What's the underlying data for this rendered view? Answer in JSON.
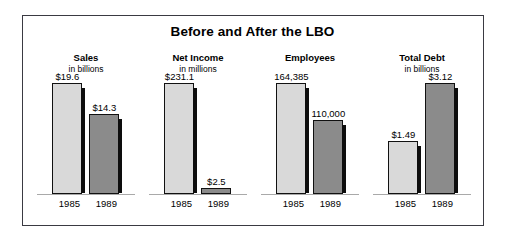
{
  "chart_data": {
    "type": "bar",
    "title": "Before and After the LBO",
    "xlabel": "",
    "ylabel": "",
    "grid": false,
    "legend": "none",
    "categories": [
      "1985",
      "1989"
    ],
    "panels": [
      {
        "title": "Sales",
        "subtitle": "in billions",
        "unit": "billions of dollars",
        "values": [
          19.6,
          14.3
        ],
        "labels": [
          "$19.6",
          "$14.3"
        ],
        "bar_heights_pct": [
          100,
          72
        ],
        "years": [
          "1985",
          "1989"
        ]
      },
      {
        "title": "Net Income",
        "subtitle": "in millions",
        "unit": "millions of dollars",
        "values": [
          231.1,
          2.5
        ],
        "labels": [
          "$231.1",
          "$2.5"
        ],
        "bar_heights_pct": [
          100,
          5
        ],
        "years": [
          "1985",
          "1989"
        ]
      },
      {
        "title": "Employees",
        "subtitle": "",
        "unit": "people",
        "values": [
          164385,
          110000
        ],
        "labels": [
          "164,385",
          "110,000"
        ],
        "bar_heights_pct": [
          100,
          67
        ],
        "years": [
          "1985",
          "1989"
        ]
      },
      {
        "title": "Total Debt",
        "subtitle": "in billions",
        "unit": "billions of dollars",
        "values": [
          1.49,
          3.12
        ],
        "labels": [
          "$1.49",
          "$3.12"
        ],
        "bar_heights_pct": [
          48,
          100
        ],
        "years": [
          "1985",
          "1989"
        ]
      }
    ],
    "colors": {
      "bar_1985": "#d9d9d9",
      "bar_1989": "#8b8b8b",
      "bar_outline": "#111111",
      "bar_shadow": "#0d0d0d",
      "baseline": "#a9a9a9",
      "frame": "#3a3a42",
      "background": "#ffffff",
      "text": "#000000"
    }
  }
}
